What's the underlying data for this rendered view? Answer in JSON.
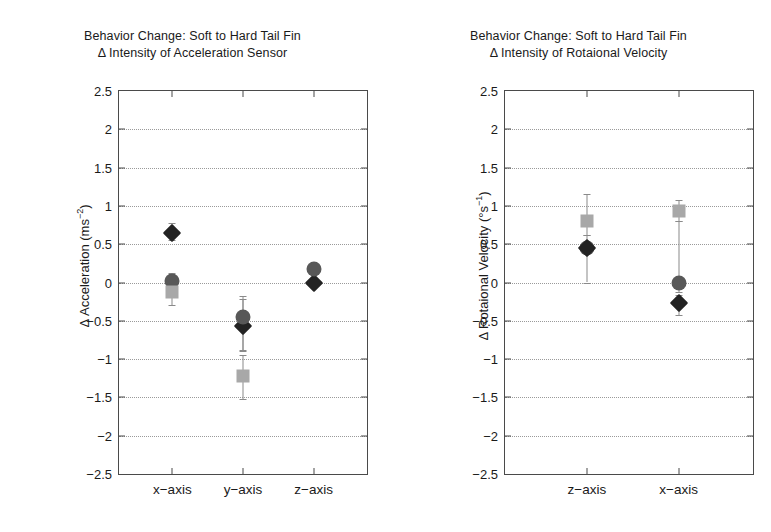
{
  "chart_data": [
    {
      "type": "scatter",
      "panel": "left",
      "title_line1": "Behavior Change: Soft to Hard Tail Fin",
      "title_line2": "Δ Intensity of Acceleration Sensor",
      "ylabel_text": "Δ Acceleration (ms",
      "ylabel_sup": "−2",
      "ylabel_close": ")",
      "xlabel": "",
      "categories": [
        "x−axis",
        "y−axis",
        "z−axis"
      ],
      "ylim": [
        -2.5,
        2.5
      ],
      "ytick_labels": [
        "2.5",
        "2",
        "1.5",
        "1",
        "0.5",
        "0",
        "−0.5",
        "−1",
        "−1.5",
        "−2",
        "−2.5"
      ],
      "ytick_values": [
        2.5,
        2,
        1.5,
        1,
        0.5,
        0,
        -0.5,
        -1,
        -1.5,
        -2,
        -2.5
      ],
      "grid": true,
      "legend": "none",
      "series": [
        {
          "name": "diamond",
          "marker": "diamond",
          "color": "#232323",
          "points": [
            {
              "category": "x−axis",
              "value": 0.65,
              "err_low": 0.55,
              "err_high": 0.78
            },
            {
              "category": "y−axis",
              "value": -0.57,
              "err_low": -0.9,
              "err_high": -0.22
            },
            {
              "category": "z−axis",
              "value": 0.0,
              "err_low": -0.05,
              "err_high": 0.05
            }
          ]
        },
        {
          "name": "circle",
          "marker": "circle",
          "color": "#585858",
          "points": [
            {
              "category": "x−axis",
              "value": 0.02,
              "err_low": -0.07,
              "err_high": 0.12
            },
            {
              "category": "y−axis",
              "value": -0.45,
              "err_low": -0.88,
              "err_high": -0.18
            },
            {
              "category": "z−axis",
              "value": 0.18,
              "err_low": 0.12,
              "err_high": 0.25
            }
          ]
        },
        {
          "name": "square",
          "marker": "square",
          "color": "#a8a8a8",
          "points": [
            {
              "category": "x−axis",
              "value": -0.12,
              "err_low": -0.3,
              "err_high": -0.02
            },
            {
              "category": "y−axis",
              "value": -1.22,
              "err_low": -1.52,
              "err_high": -0.95
            },
            {
              "category": "z−axis",
              "value": null,
              "err_low": null,
              "err_high": null
            }
          ]
        }
      ]
    },
    {
      "type": "scatter",
      "panel": "right",
      "title_line1": "Behavior Change: Soft to Hard Tail Fin",
      "title_line2": "Δ Intensity of Rotaional Velocity",
      "ylabel_text": "Δ Rotaional Velocity (°s",
      "ylabel_sup": "−1",
      "ylabel_close": ")",
      "xlabel": "",
      "categories": [
        "z−axis",
        "x−axis"
      ],
      "ylim": [
        -2.5,
        2.5
      ],
      "ytick_labels": [
        "2.5",
        "2",
        "1.5",
        "1",
        "0.5",
        "0",
        "−0.5",
        "−1",
        "−1.5",
        "−2",
        "−2.5"
      ],
      "ytick_values": [
        2.5,
        2,
        1.5,
        1,
        0.5,
        0,
        -0.5,
        -1,
        -1.5,
        -2,
        -2.5
      ],
      "grid": true,
      "legend": "none",
      "series": [
        {
          "name": "square",
          "marker": "square",
          "color": "#a8a8a8",
          "points": [
            {
              "category": "z−axis",
              "value": 0.8,
              "err_low": 0.62,
              "err_high": 1.15
            },
            {
              "category": "x−axis",
              "value": 0.93,
              "err_low": 0.8,
              "err_high": 1.08
            }
          ]
        },
        {
          "name": "circle",
          "marker": "circle",
          "color": "#585858",
          "points": [
            {
              "category": "z−axis",
              "value": 0.45,
              "err_low": 0.0,
              "err_high": 0.62
            },
            {
              "category": "x−axis",
              "value": 0.0,
              "err_low": -0.12,
              "err_high": 0.8
            }
          ]
        },
        {
          "name": "diamond",
          "marker": "diamond",
          "color": "#232323",
          "points": [
            {
              "category": "z−axis",
              "value": 0.45,
              "err_low": 0.38,
              "err_high": 0.52
            },
            {
              "category": "x−axis",
              "value": -0.27,
              "err_low": -0.42,
              "err_high": -0.16
            }
          ]
        }
      ]
    }
  ]
}
